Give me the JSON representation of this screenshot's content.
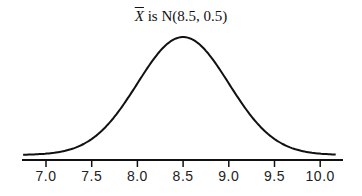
{
  "chart_data": {
    "type": "line",
    "title_parts": {
      "variable": "X",
      "text": " is N(8.5, 0.5)"
    },
    "distribution": {
      "name": "normal",
      "mean": 8.5,
      "sd": 0.5
    },
    "xlabel": "",
    "ylabel": "",
    "xlim": [
      6.75,
      10.2
    ],
    "xticks": [
      7.0,
      7.5,
      8.0,
      8.5,
      9.0,
      9.5,
      10.0
    ],
    "xtick_labels": [
      "7.0",
      "7.5",
      "8.0",
      "8.5",
      "9.0",
      "9.5",
      "10.0"
    ],
    "yaxis_visible": false,
    "grid": false,
    "legend": null,
    "series": [
      {
        "name": "density",
        "color": "#111111"
      }
    ]
  }
}
